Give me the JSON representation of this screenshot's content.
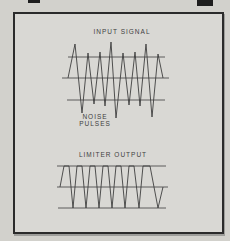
{
  "colors": {
    "page_bg": "#d2d1cc",
    "frame_bg": "#d9d8d4",
    "frame_border": "#2b2b2b",
    "line": "#3e3e3e",
    "text": "#3f3f3f",
    "edge_mark": "#1e1e1e"
  },
  "chart_data": [
    {
      "type": "line",
      "title": "INPUT SIGNAL",
      "annotation_line1": "NOISE",
      "annotation_line2": "PULSES",
      "description": "oscillating carrier signal with tall noise pulses exceeding the upper and lower clipping reference lines; three horizontal reference lines (upper clip level, center axis, lower clip level)",
      "ref_lines": [
        [
          68,
          57,
          165,
          57
        ],
        [
          62,
          78,
          169,
          78
        ],
        [
          67,
          100,
          165,
          100
        ]
      ],
      "points": [
        [
          68,
          78
        ],
        [
          75,
          44
        ],
        [
          82,
          113
        ],
        [
          88,
          53
        ],
        [
          94,
          104
        ],
        [
          100,
          52
        ],
        [
          105,
          106
        ],
        [
          111,
          42
        ],
        [
          116,
          118
        ],
        [
          123,
          53
        ],
        [
          129,
          105
        ],
        [
          135,
          52
        ],
        [
          140,
          106
        ],
        [
          146,
          44
        ],
        [
          152,
          117
        ],
        [
          158,
          54
        ],
        [
          163,
          78
        ]
      ]
    },
    {
      "type": "line",
      "title": "LIMITER OUTPUT",
      "description": "clipped trapezoidal waveform with flat tops and bottoms held at the limiter levels; three horizontal reference lines (upper limit, center axis, lower limit)",
      "ref_lines": [
        [
          57,
          166,
          166,
          166
        ],
        [
          57,
          187,
          168,
          187
        ],
        [
          58,
          208,
          166,
          208
        ]
      ],
      "points": [
        [
          60,
          187
        ],
        [
          64,
          166
        ],
        [
          69,
          166
        ],
        [
          73,
          208
        ],
        [
          77,
          166
        ],
        [
          82,
          166
        ],
        [
          86,
          208
        ],
        [
          90,
          166
        ],
        [
          95,
          166
        ],
        [
          99,
          208
        ],
        [
          103,
          166
        ],
        [
          108,
          166
        ],
        [
          112,
          208
        ],
        [
          116,
          166
        ],
        [
          121,
          166
        ],
        [
          125,
          208
        ],
        [
          129,
          166
        ],
        [
          134,
          166
        ],
        [
          139,
          208
        ],
        [
          143,
          166
        ],
        [
          150,
          166
        ],
        [
          158,
          208
        ],
        [
          163,
          187
        ]
      ]
    }
  ]
}
